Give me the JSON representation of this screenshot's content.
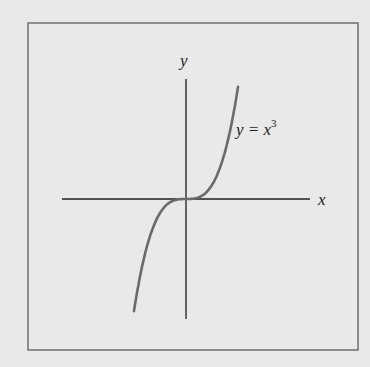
{
  "figure": {
    "y_axis_label": "y",
    "x_axis_label": "x",
    "curve_label_prefix": "y = x",
    "curve_label_exponent": "3",
    "colors": {
      "background": "#e9e9e9",
      "frame": "#6e6e6e",
      "axes": "#1e1e1e",
      "curve": "#6a6a6a"
    }
  },
  "chart_data": {
    "type": "line",
    "title": "",
    "function": "y = x^3",
    "xlabel": "x",
    "ylabel": "y",
    "series": [
      {
        "name": "y = x^3",
        "x": [
          -1.4,
          -1.0,
          -0.5,
          0,
          0.5,
          1.0,
          1.4
        ],
        "y": [
          -2.74,
          -1.0,
          -0.125,
          0,
          0.125,
          1.0,
          2.74
        ]
      }
    ],
    "grid": false,
    "ticks": false,
    "legend": "none"
  }
}
